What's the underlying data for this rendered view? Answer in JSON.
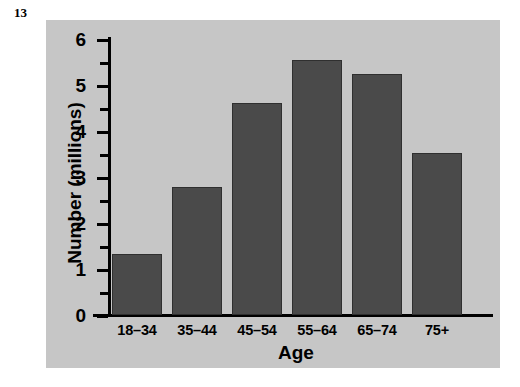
{
  "figure": {
    "number": "13"
  },
  "colors": {
    "panel_background": "#c6c6c6",
    "bar_fill": "#4a4a4a",
    "bar_outline": "#2f2f2f",
    "axis": "#000000",
    "page_background": "#ffffff"
  },
  "chart_data": {
    "type": "bar",
    "title": "",
    "xlabel": "Age",
    "ylabel": "Number (millions)",
    "categories": [
      "18–34",
      "35–44",
      "45–54",
      "55–64",
      "65–74",
      "75+"
    ],
    "values": [
      1.33,
      2.79,
      4.61,
      5.54,
      5.24,
      3.52
    ],
    "ylim": [
      0,
      6
    ],
    "ytick_labels": [
      "0",
      "1",
      "2",
      "3",
      "4",
      "5",
      "6"
    ],
    "ytick_values": [
      0,
      1,
      2,
      3,
      4,
      5,
      6
    ],
    "yminor_tick_values": [
      0.5,
      1.5,
      2.5,
      3.5,
      4.5,
      5.5
    ],
    "grid": false,
    "legend": null
  }
}
